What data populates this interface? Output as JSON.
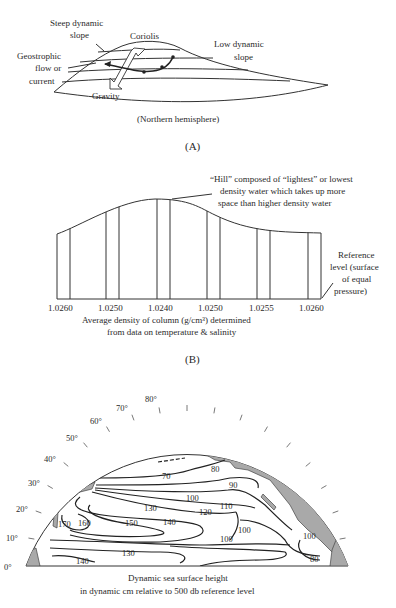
{
  "panel_a": {
    "labels": {
      "steep_slope": [
        "Steep dynamic",
        "slope"
      ],
      "coriolis": "Coriolis",
      "low_slope": [
        "Low dynamic",
        "slope"
      ],
      "geostrophic": [
        "Geostrophic",
        "flow or",
        "current"
      ],
      "gravity": "Gravity",
      "hemisphere": "(Northern hemisphere)"
    },
    "caption": "(A)"
  },
  "panel_b": {
    "annotation": [
      "“Hill” composed of “lightest” or lowest",
      "density water which takes up more",
      "space than higher density water"
    ],
    "reference": [
      "Reference",
      "level (surface",
      "of equal",
      "pressure)"
    ],
    "density_ticks": [
      "1.0260",
      "1.0250",
      "1.0240",
      "1.0250",
      "1.0255",
      "1.0260"
    ],
    "axis_label": [
      "Average density of column (g/cm³) determined",
      "from data on temperature & salinity"
    ],
    "caption": "(B)"
  },
  "panel_c": {
    "latitude_labels": [
      "0°",
      "10°",
      "20°",
      "30°",
      "40°",
      "50°",
      "60°",
      "70°",
      "80°"
    ],
    "contour_labels": [
      "70",
      "80",
      "90",
      "100",
      "110",
      "120",
      "130",
      "140",
      "150",
      "160",
      "170",
      "100",
      "100",
      "100",
      "130",
      "140",
      "80"
    ],
    "caption": [
      "Dynamic sea surface height",
      "in dynamic cm relative to 500 db reference level"
    ]
  }
}
